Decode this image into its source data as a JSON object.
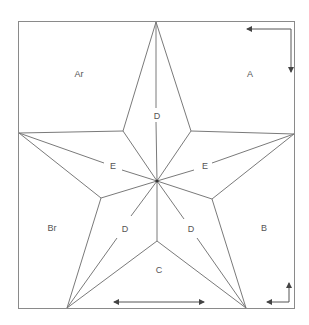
{
  "diagram": {
    "type": "star-fold-pattern",
    "colors": {
      "line": "#7a7a7a",
      "frame": "#8a8a8a",
      "text": "#555555",
      "background": "#ffffff"
    },
    "regions": {
      "top_left": "Ar",
      "top_right": "A",
      "bottom_left": "Br",
      "bottom_right": "B",
      "bottom_center": "C"
    },
    "fold_labels": {
      "top_vertical": "D",
      "left_diagonal": "E",
      "right_diagonal": "E",
      "lower_left": "D",
      "lower_right": "D"
    },
    "arrows": {
      "top_right": "corner-arrow-left-and-down",
      "bottom_center": "double-arrow-horizontal",
      "bottom_right": "corner-arrow-up-and-left"
    }
  }
}
